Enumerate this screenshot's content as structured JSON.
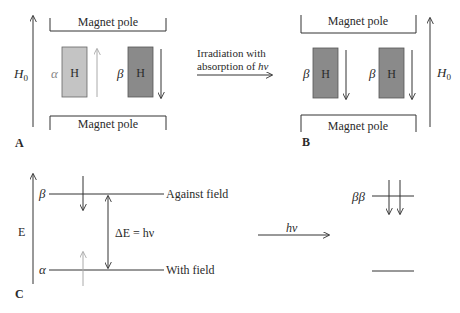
{
  "panel_a": {
    "label": "A",
    "top_pole": "Magnet pole",
    "bottom_pole": "Magnet pole",
    "field_label": "H",
    "field_sub": "0",
    "proton1": {
      "spin": "α",
      "text": "H",
      "color": "#c4c4c4",
      "direction": "up"
    },
    "proton2": {
      "spin": "β",
      "text": "H",
      "color": "#8a8a8a",
      "direction": "down"
    }
  },
  "transition": {
    "line1": "Irradiation with",
    "line2_prefix": "absorption of ",
    "line2_italic": "hν"
  },
  "panel_b": {
    "label": "B",
    "top_pole": "Magnet pole",
    "bottom_pole": "Magnet pole",
    "field_label": "H",
    "field_sub": "0",
    "proton1": {
      "spin": "β",
      "text": "H",
      "color": "#8a8a8a",
      "direction": "down"
    },
    "proton2": {
      "spin": "β",
      "text": "H",
      "color": "#8a8a8a",
      "direction": "down"
    }
  },
  "panel_c": {
    "label": "C",
    "axis_label": "E",
    "upper_level": {
      "spin": "β",
      "text": "Against field"
    },
    "lower_level": {
      "spin": "α",
      "text": "With field"
    },
    "gap_label": "ΔE = hν",
    "transition_label": "hν",
    "final_upper_spin": "ββ"
  }
}
